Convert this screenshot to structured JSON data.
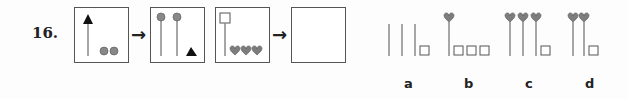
{
  "question": {
    "number": "16.",
    "sequence_boxes": [
      "box-1",
      "box-2",
      "box-3",
      "box-answer-empty"
    ],
    "options": [
      {
        "label": "a"
      },
      {
        "label": "b"
      },
      {
        "label": "c"
      },
      {
        "label": "d"
      }
    ]
  }
}
